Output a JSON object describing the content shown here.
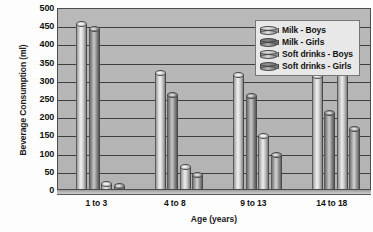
{
  "chart_data": {
    "type": "bar",
    "title": "",
    "xlabel": "Age (years)",
    "ylabel": "Beverage Consumption (ml)",
    "categories": [
      "1 to 3",
      "4 to 8",
      "9 to 13",
      "14 to 18"
    ],
    "ylim": [
      0,
      500
    ],
    "yticks": [
      0,
      50,
      100,
      150,
      200,
      250,
      300,
      350,
      400,
      450,
      500
    ],
    "ytick_labels": [
      "0",
      "50",
      "100",
      "150",
      "200",
      "250",
      "300",
      "350",
      "400",
      "450",
      "500"
    ],
    "grid": true,
    "legend_position": "top-right",
    "series": [
      {
        "name": "Milk - Boys",
        "values": [
          460,
          325,
          320,
          315
        ]
      },
      {
        "name": "Milk - Girls",
        "values": [
          445,
          265,
          260,
          215
        ]
      },
      {
        "name": "Soft drinks - Boys",
        "values": [
          20,
          65,
          150,
          375
        ]
      },
      {
        "name": "Soft drinks - Girls",
        "values": [
          15,
          45,
          100,
          170
        ]
      }
    ]
  },
  "legend": {
    "items": [
      {
        "label": "Milk - Boys",
        "swatch": "cylinder-light-icon"
      },
      {
        "label": "Milk - Girls",
        "swatch": "cylinder-dark-icon"
      },
      {
        "label": "Soft drinks - Boys",
        "swatch": "cylinder-light-icon"
      },
      {
        "label": "Soft drinks - Girls",
        "swatch": "cylinder-mid-icon"
      }
    ]
  },
  "colors": {
    "plot_background": "#b6b6b6",
    "gridline": "#3e3e3e",
    "axis": "#4c4c4c",
    "legend_background": "#e8e8e8",
    "text": "#111111"
  }
}
